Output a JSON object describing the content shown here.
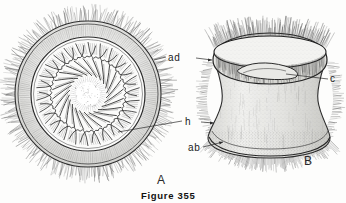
{
  "figure": {
    "caption": "Figure 355",
    "panels": [
      {
        "id": "A",
        "letter": "A",
        "view": "apical-view"
      },
      {
        "id": "B",
        "letter": "B",
        "view": "lateral-view"
      }
    ],
    "labels": [
      {
        "key": "ad",
        "text": "ad",
        "target": "adoral-zone-of-membranelles"
      },
      {
        "key": "c",
        "text": "c",
        "target": "cytostome"
      },
      {
        "key": "h",
        "text": "h",
        "target": "haplokinety"
      },
      {
        "key": "ab",
        "text": "ab",
        "target": "aboral-ciliary-girdle"
      }
    ]
  },
  "colors": {
    "ink": "#1b1b1b",
    "line": "#3a3a3a",
    "stipple": "#6e6e6e",
    "background": "#fdfdfc"
  }
}
